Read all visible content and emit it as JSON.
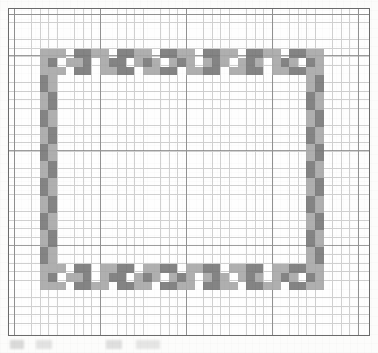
{
  "document": {
    "kind": "needlework-chart-scan",
    "title": "Cross-stitch border pattern chart",
    "page_background": "#fcfcfb"
  },
  "chart_frame": {
    "border_color": "#6b6b6b",
    "fill_color": "#fefefe",
    "left": 8,
    "top": 8,
    "width": 362,
    "height": 328
  },
  "graph_paper": {
    "cell_size_px": 8.6,
    "minor_line_color": "#c8c8c8",
    "major_line_color": "#7d7d7d",
    "major_every_cells_x": 10,
    "major_every_cells_y": 11,
    "origin_x": 5,
    "origin_y": 6
  },
  "palette": {
    "light": "#a9a9a9",
    "dark": "#7a7a7a",
    "empty": "#fefefe"
  },
  "chart_data": {
    "type": "heatmap",
    "xlabel": "",
    "ylabel": "",
    "grid": true,
    "legend": [],
    "columns": 40,
    "rows": 35,
    "symbols": {
      "0": "empty",
      "1": "light",
      "2": "dark"
    },
    "colors": {
      "0": "#fefefe",
      "1": "#a9a9a9",
      "2": "#7a7a7a"
    },
    "note": "Rectangular decorative border, 3 stitch-rows thick, repeating checkered motif in two grey shades.",
    "cells": [
      {
        "c": 3,
        "r": 4,
        "v": 1
      },
      {
        "c": 4,
        "r": 4,
        "v": 1
      },
      {
        "c": 5,
        "r": 4,
        "v": 1
      },
      {
        "c": 6,
        "r": 4,
        "v": 0
      },
      {
        "c": 7,
        "r": 4,
        "v": 2
      },
      {
        "c": 8,
        "r": 4,
        "v": 2
      },
      {
        "c": 9,
        "r": 4,
        "v": 1
      },
      {
        "c": 10,
        "r": 4,
        "v": 1
      },
      {
        "c": 11,
        "r": 4,
        "v": 0
      },
      {
        "c": 12,
        "r": 4,
        "v": 2
      },
      {
        "c": 13,
        "r": 4,
        "v": 2
      },
      {
        "c": 14,
        "r": 4,
        "v": 1
      },
      {
        "c": 15,
        "r": 4,
        "v": 1
      },
      {
        "c": 16,
        "r": 4,
        "v": 0
      },
      {
        "c": 17,
        "r": 4,
        "v": 2
      },
      {
        "c": 18,
        "r": 4,
        "v": 2
      },
      {
        "c": 19,
        "r": 4,
        "v": 1
      },
      {
        "c": 20,
        "r": 4,
        "v": 1
      },
      {
        "c": 21,
        "r": 4,
        "v": 0
      },
      {
        "c": 22,
        "r": 4,
        "v": 2
      },
      {
        "c": 23,
        "r": 4,
        "v": 2
      },
      {
        "c": 24,
        "r": 4,
        "v": 1
      },
      {
        "c": 25,
        "r": 4,
        "v": 1
      },
      {
        "c": 26,
        "r": 4,
        "v": 0
      },
      {
        "c": 27,
        "r": 4,
        "v": 2
      },
      {
        "c": 28,
        "r": 4,
        "v": 2
      },
      {
        "c": 29,
        "r": 4,
        "v": 1
      },
      {
        "c": 30,
        "r": 4,
        "v": 1
      },
      {
        "c": 31,
        "r": 4,
        "v": 0
      },
      {
        "c": 32,
        "r": 4,
        "v": 2
      },
      {
        "c": 33,
        "r": 4,
        "v": 2
      },
      {
        "c": 34,
        "r": 4,
        "v": 1
      },
      {
        "c": 35,
        "r": 4,
        "v": 1
      },
      {
        "c": 3,
        "r": 5,
        "v": 1
      },
      {
        "c": 4,
        "r": 5,
        "v": 2
      },
      {
        "c": 5,
        "r": 5,
        "v": 0
      },
      {
        "c": 6,
        "r": 5,
        "v": 1
      },
      {
        "c": 7,
        "r": 5,
        "v": 1
      },
      {
        "c": 8,
        "r": 5,
        "v": 2
      },
      {
        "c": 9,
        "r": 5,
        "v": 0
      },
      {
        "c": 10,
        "r": 5,
        "v": 1
      },
      {
        "c": 11,
        "r": 5,
        "v": 2
      },
      {
        "c": 12,
        "r": 5,
        "v": 2
      },
      {
        "c": 13,
        "r": 5,
        "v": 0
      },
      {
        "c": 14,
        "r": 5,
        "v": 1
      },
      {
        "c": 15,
        "r": 5,
        "v": 2
      },
      {
        "c": 16,
        "r": 5,
        "v": 1
      },
      {
        "c": 17,
        "r": 5,
        "v": 0
      },
      {
        "c": 18,
        "r": 5,
        "v": 1
      },
      {
        "c": 19,
        "r": 5,
        "v": 2
      },
      {
        "c": 20,
        "r": 5,
        "v": 1
      },
      {
        "c": 21,
        "r": 5,
        "v": 0
      },
      {
        "c": 22,
        "r": 5,
        "v": 1
      },
      {
        "c": 23,
        "r": 5,
        "v": 2
      },
      {
        "c": 24,
        "r": 5,
        "v": 1
      },
      {
        "c": 25,
        "r": 5,
        "v": 0
      },
      {
        "c": 26,
        "r": 5,
        "v": 1
      },
      {
        "c": 27,
        "r": 5,
        "v": 2
      },
      {
        "c": 28,
        "r": 5,
        "v": 1
      },
      {
        "c": 29,
        "r": 5,
        "v": 0
      },
      {
        "c": 30,
        "r": 5,
        "v": 1
      },
      {
        "c": 31,
        "r": 5,
        "v": 2
      },
      {
        "c": 32,
        "r": 5,
        "v": 1
      },
      {
        "c": 33,
        "r": 5,
        "v": 0
      },
      {
        "c": 34,
        "r": 5,
        "v": 2
      },
      {
        "c": 35,
        "r": 5,
        "v": 1
      },
      {
        "c": 3,
        "r": 6,
        "v": 1
      },
      {
        "c": 4,
        "r": 6,
        "v": 1
      },
      {
        "c": 5,
        "r": 6,
        "v": 1
      },
      {
        "c": 6,
        "r": 6,
        "v": 0
      },
      {
        "c": 7,
        "r": 6,
        "v": 2
      },
      {
        "c": 8,
        "r": 6,
        "v": 2
      },
      {
        "c": 9,
        "r": 6,
        "v": 0
      },
      {
        "c": 10,
        "r": 6,
        "v": 1
      },
      {
        "c": 11,
        "r": 6,
        "v": 1
      },
      {
        "c": 12,
        "r": 6,
        "v": 2
      },
      {
        "c": 13,
        "r": 6,
        "v": 2
      },
      {
        "c": 14,
        "r": 6,
        "v": 0
      },
      {
        "c": 15,
        "r": 6,
        "v": 1
      },
      {
        "c": 16,
        "r": 6,
        "v": 1
      },
      {
        "c": 17,
        "r": 6,
        "v": 2
      },
      {
        "c": 18,
        "r": 6,
        "v": 2
      },
      {
        "c": 19,
        "r": 6,
        "v": 0
      },
      {
        "c": 20,
        "r": 6,
        "v": 1
      },
      {
        "c": 21,
        "r": 6,
        "v": 1
      },
      {
        "c": 22,
        "r": 6,
        "v": 2
      },
      {
        "c": 23,
        "r": 6,
        "v": 2
      },
      {
        "c": 24,
        "r": 6,
        "v": 0
      },
      {
        "c": 25,
        "r": 6,
        "v": 1
      },
      {
        "c": 26,
        "r": 6,
        "v": 1
      },
      {
        "c": 27,
        "r": 6,
        "v": 2
      },
      {
        "c": 28,
        "r": 6,
        "v": 2
      },
      {
        "c": 29,
        "r": 6,
        "v": 0
      },
      {
        "c": 30,
        "r": 6,
        "v": 1
      },
      {
        "c": 31,
        "r": 6,
        "v": 1
      },
      {
        "c": 32,
        "r": 6,
        "v": 2
      },
      {
        "c": 33,
        "r": 6,
        "v": 2
      },
      {
        "c": 34,
        "r": 6,
        "v": 1
      },
      {
        "c": 35,
        "r": 6,
        "v": 1
      },
      {
        "c": 3,
        "r": 7,
        "v": 2
      },
      {
        "c": 4,
        "r": 7,
        "v": 1
      },
      {
        "c": 3,
        "r": 8,
        "v": 2
      },
      {
        "c": 4,
        "r": 8,
        "v": 1
      },
      {
        "c": 3,
        "r": 9,
        "v": 1
      },
      {
        "c": 4,
        "r": 9,
        "v": 2
      },
      {
        "c": 3,
        "r": 10,
        "v": 1
      },
      {
        "c": 4,
        "r": 10,
        "v": 2
      },
      {
        "c": 3,
        "r": 11,
        "v": 2
      },
      {
        "c": 4,
        "r": 11,
        "v": 1
      },
      {
        "c": 3,
        "r": 12,
        "v": 2
      },
      {
        "c": 4,
        "r": 12,
        "v": 1
      },
      {
        "c": 3,
        "r": 13,
        "v": 1
      },
      {
        "c": 4,
        "r": 13,
        "v": 2
      },
      {
        "c": 3,
        "r": 14,
        "v": 1
      },
      {
        "c": 4,
        "r": 14,
        "v": 2
      },
      {
        "c": 3,
        "r": 15,
        "v": 2
      },
      {
        "c": 4,
        "r": 15,
        "v": 1
      },
      {
        "c": 3,
        "r": 16,
        "v": 2
      },
      {
        "c": 4,
        "r": 16,
        "v": 1
      },
      {
        "c": 3,
        "r": 17,
        "v": 1
      },
      {
        "c": 4,
        "r": 17,
        "v": 2
      },
      {
        "c": 3,
        "r": 18,
        "v": 1
      },
      {
        "c": 4,
        "r": 18,
        "v": 2
      },
      {
        "c": 3,
        "r": 19,
        "v": 2
      },
      {
        "c": 4,
        "r": 19,
        "v": 1
      },
      {
        "c": 3,
        "r": 20,
        "v": 2
      },
      {
        "c": 4,
        "r": 20,
        "v": 1
      },
      {
        "c": 3,
        "r": 21,
        "v": 1
      },
      {
        "c": 4,
        "r": 21,
        "v": 2
      },
      {
        "c": 3,
        "r": 22,
        "v": 1
      },
      {
        "c": 4,
        "r": 22,
        "v": 2
      },
      {
        "c": 3,
        "r": 23,
        "v": 2
      },
      {
        "c": 4,
        "r": 23,
        "v": 1
      },
      {
        "c": 3,
        "r": 24,
        "v": 2
      },
      {
        "c": 4,
        "r": 24,
        "v": 1
      },
      {
        "c": 3,
        "r": 25,
        "v": 1
      },
      {
        "c": 4,
        "r": 25,
        "v": 2
      },
      {
        "c": 3,
        "r": 26,
        "v": 1
      },
      {
        "c": 4,
        "r": 26,
        "v": 2
      },
      {
        "c": 3,
        "r": 27,
        "v": 2
      },
      {
        "c": 4,
        "r": 27,
        "v": 1
      },
      {
        "c": 3,
        "r": 28,
        "v": 2
      },
      {
        "c": 4,
        "r": 28,
        "v": 1
      },
      {
        "c": 34,
        "r": 7,
        "v": 1
      },
      {
        "c": 35,
        "r": 7,
        "v": 2
      },
      {
        "c": 34,
        "r": 8,
        "v": 1
      },
      {
        "c": 35,
        "r": 8,
        "v": 2
      },
      {
        "c": 34,
        "r": 9,
        "v": 2
      },
      {
        "c": 35,
        "r": 9,
        "v": 1
      },
      {
        "c": 34,
        "r": 10,
        "v": 2
      },
      {
        "c": 35,
        "r": 10,
        "v": 1
      },
      {
        "c": 34,
        "r": 11,
        "v": 1
      },
      {
        "c": 35,
        "r": 11,
        "v": 2
      },
      {
        "c": 34,
        "r": 12,
        "v": 1
      },
      {
        "c": 35,
        "r": 12,
        "v": 2
      },
      {
        "c": 34,
        "r": 13,
        "v": 2
      },
      {
        "c": 35,
        "r": 13,
        "v": 1
      },
      {
        "c": 34,
        "r": 14,
        "v": 2
      },
      {
        "c": 35,
        "r": 14,
        "v": 1
      },
      {
        "c": 34,
        "r": 15,
        "v": 1
      },
      {
        "c": 35,
        "r": 15,
        "v": 2
      },
      {
        "c": 34,
        "r": 16,
        "v": 1
      },
      {
        "c": 35,
        "r": 16,
        "v": 2
      },
      {
        "c": 34,
        "r": 17,
        "v": 2
      },
      {
        "c": 35,
        "r": 17,
        "v": 1
      },
      {
        "c": 34,
        "r": 18,
        "v": 2
      },
      {
        "c": 35,
        "r": 18,
        "v": 1
      },
      {
        "c": 34,
        "r": 19,
        "v": 1
      },
      {
        "c": 35,
        "r": 19,
        "v": 2
      },
      {
        "c": 34,
        "r": 20,
        "v": 1
      },
      {
        "c": 35,
        "r": 20,
        "v": 2
      },
      {
        "c": 34,
        "r": 21,
        "v": 2
      },
      {
        "c": 35,
        "r": 21,
        "v": 1
      },
      {
        "c": 34,
        "r": 22,
        "v": 2
      },
      {
        "c": 35,
        "r": 22,
        "v": 1
      },
      {
        "c": 34,
        "r": 23,
        "v": 1
      },
      {
        "c": 35,
        "r": 23,
        "v": 2
      },
      {
        "c": 34,
        "r": 24,
        "v": 1
      },
      {
        "c": 35,
        "r": 24,
        "v": 2
      },
      {
        "c": 34,
        "r": 25,
        "v": 2
      },
      {
        "c": 35,
        "r": 25,
        "v": 1
      },
      {
        "c": 34,
        "r": 26,
        "v": 2
      },
      {
        "c": 35,
        "r": 26,
        "v": 1
      },
      {
        "c": 34,
        "r": 27,
        "v": 1
      },
      {
        "c": 35,
        "r": 27,
        "v": 2
      },
      {
        "c": 34,
        "r": 28,
        "v": 1
      },
      {
        "c": 35,
        "r": 28,
        "v": 2
      },
      {
        "c": 3,
        "r": 29,
        "v": 1
      },
      {
        "c": 4,
        "r": 29,
        "v": 1
      },
      {
        "c": 5,
        "r": 29,
        "v": 1
      },
      {
        "c": 6,
        "r": 29,
        "v": 0
      },
      {
        "c": 7,
        "r": 29,
        "v": 2
      },
      {
        "c": 8,
        "r": 29,
        "v": 2
      },
      {
        "c": 9,
        "r": 29,
        "v": 0
      },
      {
        "c": 10,
        "r": 29,
        "v": 1
      },
      {
        "c": 11,
        "r": 29,
        "v": 1
      },
      {
        "c": 12,
        "r": 29,
        "v": 2
      },
      {
        "c": 13,
        "r": 29,
        "v": 2
      },
      {
        "c": 14,
        "r": 29,
        "v": 0
      },
      {
        "c": 15,
        "r": 29,
        "v": 1
      },
      {
        "c": 16,
        "r": 29,
        "v": 1
      },
      {
        "c": 17,
        "r": 29,
        "v": 2
      },
      {
        "c": 18,
        "r": 29,
        "v": 2
      },
      {
        "c": 19,
        "r": 29,
        "v": 0
      },
      {
        "c": 20,
        "r": 29,
        "v": 1
      },
      {
        "c": 21,
        "r": 29,
        "v": 1
      },
      {
        "c": 22,
        "r": 29,
        "v": 2
      },
      {
        "c": 23,
        "r": 29,
        "v": 2
      },
      {
        "c": 24,
        "r": 29,
        "v": 0
      },
      {
        "c": 25,
        "r": 29,
        "v": 1
      },
      {
        "c": 26,
        "r": 29,
        "v": 1
      },
      {
        "c": 27,
        "r": 29,
        "v": 2
      },
      {
        "c": 28,
        "r": 29,
        "v": 2
      },
      {
        "c": 29,
        "r": 29,
        "v": 0
      },
      {
        "c": 30,
        "r": 29,
        "v": 1
      },
      {
        "c": 31,
        "r": 29,
        "v": 1
      },
      {
        "c": 32,
        "r": 29,
        "v": 2
      },
      {
        "c": 33,
        "r": 29,
        "v": 2
      },
      {
        "c": 34,
        "r": 29,
        "v": 1
      },
      {
        "c": 35,
        "r": 29,
        "v": 1
      },
      {
        "c": 3,
        "r": 30,
        "v": 1
      },
      {
        "c": 4,
        "r": 30,
        "v": 2
      },
      {
        "c": 5,
        "r": 30,
        "v": 0
      },
      {
        "c": 6,
        "r": 30,
        "v": 1
      },
      {
        "c": 7,
        "r": 30,
        "v": 1
      },
      {
        "c": 8,
        "r": 30,
        "v": 2
      },
      {
        "c": 9,
        "r": 30,
        "v": 0
      },
      {
        "c": 10,
        "r": 30,
        "v": 1
      },
      {
        "c": 11,
        "r": 30,
        "v": 2
      },
      {
        "c": 12,
        "r": 30,
        "v": 2
      },
      {
        "c": 13,
        "r": 30,
        "v": 0
      },
      {
        "c": 14,
        "r": 30,
        "v": 1
      },
      {
        "c": 15,
        "r": 30,
        "v": 2
      },
      {
        "c": 16,
        "r": 30,
        "v": 1
      },
      {
        "c": 17,
        "r": 30,
        "v": 0
      },
      {
        "c": 18,
        "r": 30,
        "v": 1
      },
      {
        "c": 19,
        "r": 30,
        "v": 2
      },
      {
        "c": 20,
        "r": 30,
        "v": 1
      },
      {
        "c": 21,
        "r": 30,
        "v": 0
      },
      {
        "c": 22,
        "r": 30,
        "v": 1
      },
      {
        "c": 23,
        "r": 30,
        "v": 2
      },
      {
        "c": 24,
        "r": 30,
        "v": 1
      },
      {
        "c": 25,
        "r": 30,
        "v": 0
      },
      {
        "c": 26,
        "r": 30,
        "v": 1
      },
      {
        "c": 27,
        "r": 30,
        "v": 2
      },
      {
        "c": 28,
        "r": 30,
        "v": 1
      },
      {
        "c": 29,
        "r": 30,
        "v": 0
      },
      {
        "c": 30,
        "r": 30,
        "v": 1
      },
      {
        "c": 31,
        "r": 30,
        "v": 2
      },
      {
        "c": 32,
        "r": 30,
        "v": 1
      },
      {
        "c": 33,
        "r": 30,
        "v": 0
      },
      {
        "c": 34,
        "r": 30,
        "v": 2
      },
      {
        "c": 35,
        "r": 30,
        "v": 1
      },
      {
        "c": 3,
        "r": 31,
        "v": 1
      },
      {
        "c": 4,
        "r": 31,
        "v": 1
      },
      {
        "c": 5,
        "r": 31,
        "v": 1
      },
      {
        "c": 6,
        "r": 31,
        "v": 0
      },
      {
        "c": 7,
        "r": 31,
        "v": 2
      },
      {
        "c": 8,
        "r": 31,
        "v": 2
      },
      {
        "c": 9,
        "r": 31,
        "v": 1
      },
      {
        "c": 10,
        "r": 31,
        "v": 1
      },
      {
        "c": 11,
        "r": 31,
        "v": 0
      },
      {
        "c": 12,
        "r": 31,
        "v": 2
      },
      {
        "c": 13,
        "r": 31,
        "v": 2
      },
      {
        "c": 14,
        "r": 31,
        "v": 1
      },
      {
        "c": 15,
        "r": 31,
        "v": 1
      },
      {
        "c": 16,
        "r": 31,
        "v": 0
      },
      {
        "c": 17,
        "r": 31,
        "v": 2
      },
      {
        "c": 18,
        "r": 31,
        "v": 2
      },
      {
        "c": 19,
        "r": 31,
        "v": 1
      },
      {
        "c": 20,
        "r": 31,
        "v": 1
      },
      {
        "c": 21,
        "r": 31,
        "v": 0
      },
      {
        "c": 22,
        "r": 31,
        "v": 2
      },
      {
        "c": 23,
        "r": 31,
        "v": 2
      },
      {
        "c": 24,
        "r": 31,
        "v": 1
      },
      {
        "c": 25,
        "r": 31,
        "v": 1
      },
      {
        "c": 26,
        "r": 31,
        "v": 0
      },
      {
        "c": 27,
        "r": 31,
        "v": 2
      },
      {
        "c": 28,
        "r": 31,
        "v": 2
      },
      {
        "c": 29,
        "r": 31,
        "v": 1
      },
      {
        "c": 30,
        "r": 31,
        "v": 1
      },
      {
        "c": 31,
        "r": 31,
        "v": 0
      },
      {
        "c": 32,
        "r": 31,
        "v": 2
      },
      {
        "c": 33,
        "r": 31,
        "v": 2
      },
      {
        "c": 34,
        "r": 31,
        "v": 1
      },
      {
        "c": 35,
        "r": 31,
        "v": 1
      }
    ]
  }
}
